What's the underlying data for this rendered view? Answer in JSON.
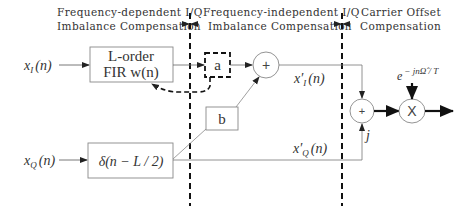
{
  "sections": {
    "left": {
      "line1": "Frequency-dependent I/Q",
      "line2": "Imbalance Compensation"
    },
    "middle": {
      "line1": "Frequency-independent I/Q",
      "line2": "Imbalance Compensation"
    },
    "right": {
      "line1": "Carrier Offset",
      "line2": "Compensation"
    }
  },
  "inputs": {
    "i_label": "x",
    "i_sub": "I",
    "i_arg": "(n)",
    "q_label": "x",
    "q_sub": "Q",
    "q_arg": "(n)"
  },
  "blocks": {
    "fir_line1": "L-order",
    "fir_line2": "FIR w(n)",
    "delay": "δ(n − L / 2)",
    "a": "a",
    "b": "b"
  },
  "operators": {
    "sum1": "+",
    "sum2": "+",
    "mult": "X"
  },
  "signals": {
    "xi_prime": "x′",
    "xi_prime_sub": "I",
    "xi_prime_arg": "(n)",
    "xq_prime": "x′",
    "xq_prime_sub": "Q",
    "xq_prime_arg": "(n)",
    "j_label": "j",
    "carrier_base": "e",
    "carrier_exp": "− jnΩ̂ / T"
  },
  "colors": {
    "line": "#666666",
    "dashed": "#111111",
    "text": "#333333"
  }
}
